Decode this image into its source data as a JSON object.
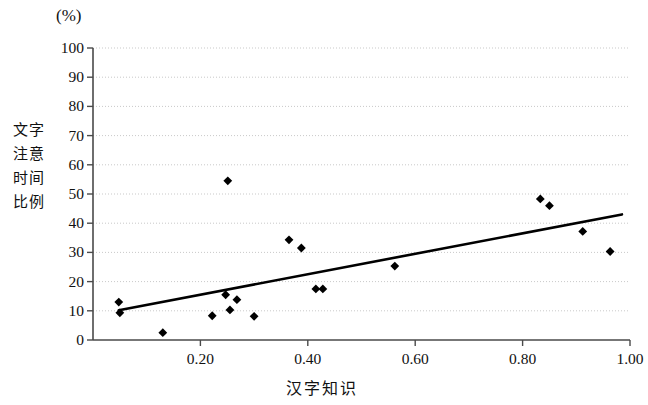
{
  "figure": {
    "unit_label": "(%)",
    "y_axis_title_rows": [
      "文字",
      "注意",
      "时间",
      "比例"
    ],
    "x_axis_title": "汉字知识"
  },
  "chart_data": {
    "type": "scatter",
    "title": "",
    "subtitle": "",
    "xlabel": "汉字知识",
    "ylabel": "文字注意时间比例",
    "y_unit": "(%)",
    "xlim": [
      0.0,
      1.0
    ],
    "ylim": [
      0,
      100
    ],
    "xticks": [
      0.2,
      0.4,
      0.6,
      0.8,
      1.0
    ],
    "xtick_labels": [
      "0.20",
      "0.40",
      "0.60",
      "0.80",
      "1.00"
    ],
    "yticks": [
      0,
      10,
      20,
      30,
      40,
      50,
      60,
      70,
      80,
      90,
      100
    ],
    "ytick_labels": [
      "0",
      "10",
      "20",
      "30",
      "40",
      "50",
      "60",
      "70",
      "80",
      "90",
      "100"
    ],
    "grid": "horizontal-dotted",
    "legend": "none",
    "marker": "filled-diamond",
    "marker_color": "#000000",
    "points": [
      {
        "x": 0.048,
        "y": 13.0
      },
      {
        "x": 0.05,
        "y": 9.3
      },
      {
        "x": 0.13,
        "y": 2.5
      },
      {
        "x": 0.222,
        "y": 8.3
      },
      {
        "x": 0.247,
        "y": 15.5
      },
      {
        "x": 0.251,
        "y": 54.5
      },
      {
        "x": 0.255,
        "y": 10.3
      },
      {
        "x": 0.268,
        "y": 13.8
      },
      {
        "x": 0.3,
        "y": 8.1
      },
      {
        "x": 0.365,
        "y": 34.3
      },
      {
        "x": 0.388,
        "y": 31.5
      },
      {
        "x": 0.415,
        "y": 17.5
      },
      {
        "x": 0.428,
        "y": 17.5
      },
      {
        "x": 0.562,
        "y": 25.3
      },
      {
        "x": 0.833,
        "y": 48.3
      },
      {
        "x": 0.85,
        "y": 46.0
      },
      {
        "x": 0.912,
        "y": 37.2
      },
      {
        "x": 0.963,
        "y": 30.3
      }
    ],
    "trendline": {
      "type": "linear-fit",
      "x_start": 0.048,
      "y_start": 10.2,
      "x_end": 0.985,
      "y_end": 43.0,
      "color": "#000000"
    }
  }
}
